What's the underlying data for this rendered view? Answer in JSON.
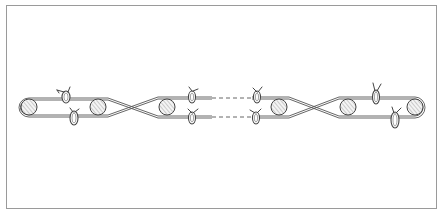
{
  "figure": {
    "colors": {
      "line": "#444444",
      "frame": "#9a9a9a",
      "background": "#ffffff",
      "roller_fill": "#f4f4f4"
    },
    "frame": {
      "x": 6,
      "y": 5,
      "width": 430,
      "height": 203
    },
    "band": {
      "top_y": 100,
      "bottom_y": 115,
      "center_y": 107
    },
    "rollers": [
      {
        "id": "roller-1",
        "cx": 29,
        "cy": 107,
        "r": 8
      },
      {
        "id": "roller-2",
        "cx": 98,
        "cy": 107,
        "r": 8
      },
      {
        "id": "roller-3",
        "cx": 167,
        "cy": 107,
        "r": 8
      },
      {
        "id": "roller-4",
        "cx": 279,
        "cy": 107,
        "r": 8
      },
      {
        "id": "roller-5",
        "cx": 348,
        "cy": 107,
        "r": 8
      },
      {
        "id": "roller-6",
        "cx": 415,
        "cy": 107,
        "r": 8
      }
    ],
    "crossings": [
      {
        "x": 133
      },
      {
        "x": 314
      }
    ],
    "break": {
      "from_x": 212,
      "to_x": 252
    },
    "clips": [
      {
        "id": "clip-1",
        "x": 66,
        "y": 97
      },
      {
        "id": "clip-2",
        "x": 74,
        "y": 118
      },
      {
        "id": "clip-3",
        "x": 192,
        "y": 97
      },
      {
        "id": "clip-4",
        "x": 192,
        "y": 118
      },
      {
        "id": "clip-5",
        "x": 257,
        "y": 97
      },
      {
        "id": "clip-6",
        "x": 256,
        "y": 118
      },
      {
        "id": "clip-7",
        "x": 376,
        "y": 97
      },
      {
        "id": "clip-8",
        "x": 395,
        "y": 120
      }
    ]
  }
}
